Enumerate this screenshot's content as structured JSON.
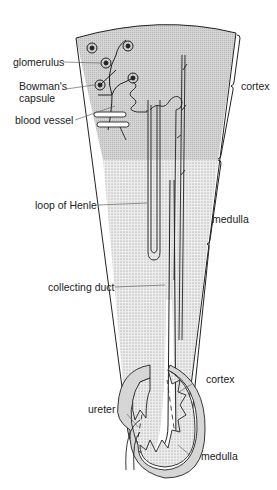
{
  "diagram": {
    "upper_labels": {
      "glomerulus": "glomerulus",
      "bowmans_capsule_line1": "Bowman's",
      "bowmans_capsule_line2": "capsule",
      "blood_vessel": "blood vessel",
      "loop_of_henle": "loop of Henle",
      "collecting_duct": "collecting duct",
      "cortex": "cortex",
      "medulla": "medulla"
    },
    "lower_labels": {
      "cortex": "cortex",
      "ureter": "ureter",
      "medulla": "medulla"
    },
    "colors": {
      "line": "#222222",
      "cortex_fill": "#d9d9d9",
      "medulla_fill": "#e6e6e6",
      "leader": "#666666"
    }
  }
}
